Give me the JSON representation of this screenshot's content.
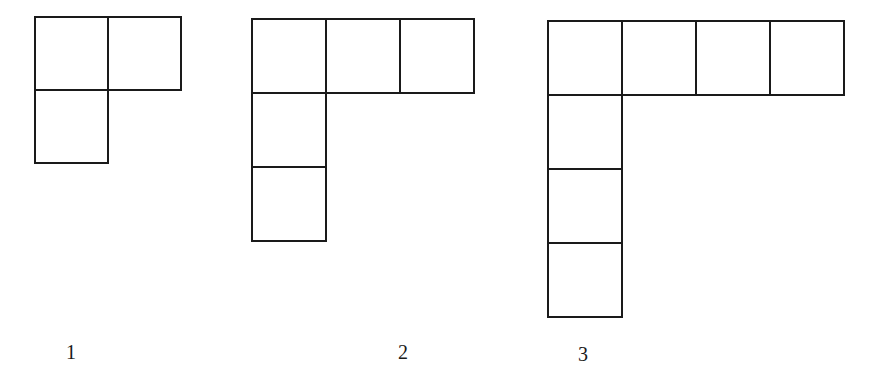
{
  "diagram": {
    "type": "square-pattern-sequence",
    "stroke_color": "#1a1a1a",
    "background": "#ffffff",
    "figures": [
      {
        "label": "1",
        "origin": [
          34,
          16
        ],
        "cell_size": 75,
        "arm_length": 1,
        "total_squares": 3,
        "cells": [
          [
            0,
            0
          ],
          [
            1,
            0
          ],
          [
            0,
            1
          ]
        ],
        "label_pos": [
          66,
          342
        ]
      },
      {
        "label": "2",
        "origin": [
          251,
          18
        ],
        "cell_size": 76,
        "arm_length": 2,
        "total_squares": 5,
        "cells": [
          [
            0,
            0
          ],
          [
            1,
            0
          ],
          [
            2,
            0
          ],
          [
            0,
            1
          ],
          [
            0,
            2
          ]
        ],
        "label_pos": [
          398,
          342
        ]
      },
      {
        "label": "3",
        "origin": [
          547,
          20
        ],
        "cell_size": 76,
        "arm_length": 3,
        "total_squares": 7,
        "cells": [
          [
            0,
            0
          ],
          [
            1,
            0
          ],
          [
            2,
            0
          ],
          [
            3,
            0
          ],
          [
            0,
            1
          ],
          [
            0,
            2
          ],
          [
            0,
            3
          ]
        ],
        "label_pos": [
          578,
          344
        ]
      }
    ]
  }
}
